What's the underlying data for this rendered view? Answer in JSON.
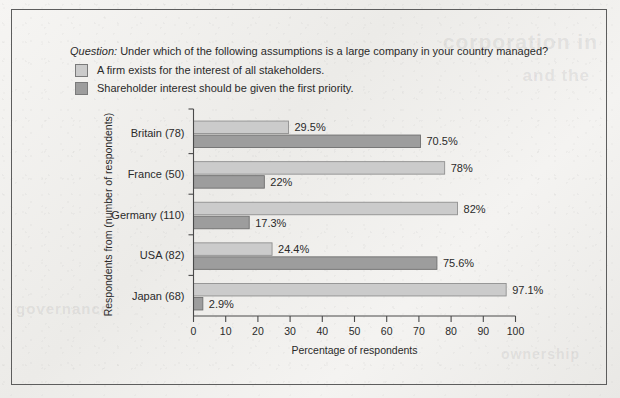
{
  "page": {
    "background_color": "#f2f1ef",
    "frame_color": "#5d5d5d",
    "ghost_bleed": {
      "line_a": "corporation in",
      "line_b": "and the",
      "line_c": "governance",
      "line_d": "ownership"
    }
  },
  "header": {
    "question_label": "Question:",
    "question_text": " Under which of the following assumptions is a large company in your country managed?"
  },
  "legend": {
    "items": [
      {
        "label": "A firm exists for the interest of all stakeholders.",
        "color": "#cbcbcb"
      },
      {
        "label": "Shareholder interest should be given the first priority.",
        "color": "#9d9d9d"
      }
    ]
  },
  "chart_data": {
    "type": "bar",
    "orientation": "horizontal",
    "title": "",
    "xlabel": "Percentage of respondents",
    "ylabel": "Respondents from (number of respondents)",
    "xlim": [
      0,
      100
    ],
    "xticks": [
      0,
      10,
      20,
      30,
      40,
      50,
      60,
      70,
      80,
      90,
      100
    ],
    "xtick_labels": [
      "0",
      "10",
      "20",
      "30",
      "40",
      "50",
      "60",
      "70",
      "80",
      "90",
      "100"
    ],
    "grid": false,
    "legend_position": "top-left",
    "categories": [
      "Britain (78)",
      "France (50)",
      "Germany (110)",
      "USA (82)",
      "Japan (68)"
    ],
    "series": [
      {
        "name": "A firm exists for the interest of all stakeholders.",
        "color": "#cbcbcb",
        "values": [
          29.5,
          78,
          82,
          24.4,
          97.1
        ],
        "data_labels": [
          "29.5%",
          "78%",
          "82%",
          "24.4%",
          "97.1%"
        ]
      },
      {
        "name": "Shareholder interest should be given the first priority.",
        "color": "#9d9d9d",
        "values": [
          70.5,
          22,
          17.3,
          75.6,
          2.9
        ],
        "data_labels": [
          "70.5%",
          "22%",
          "17.3%",
          "75.6%",
          "2.9%"
        ]
      }
    ]
  }
}
